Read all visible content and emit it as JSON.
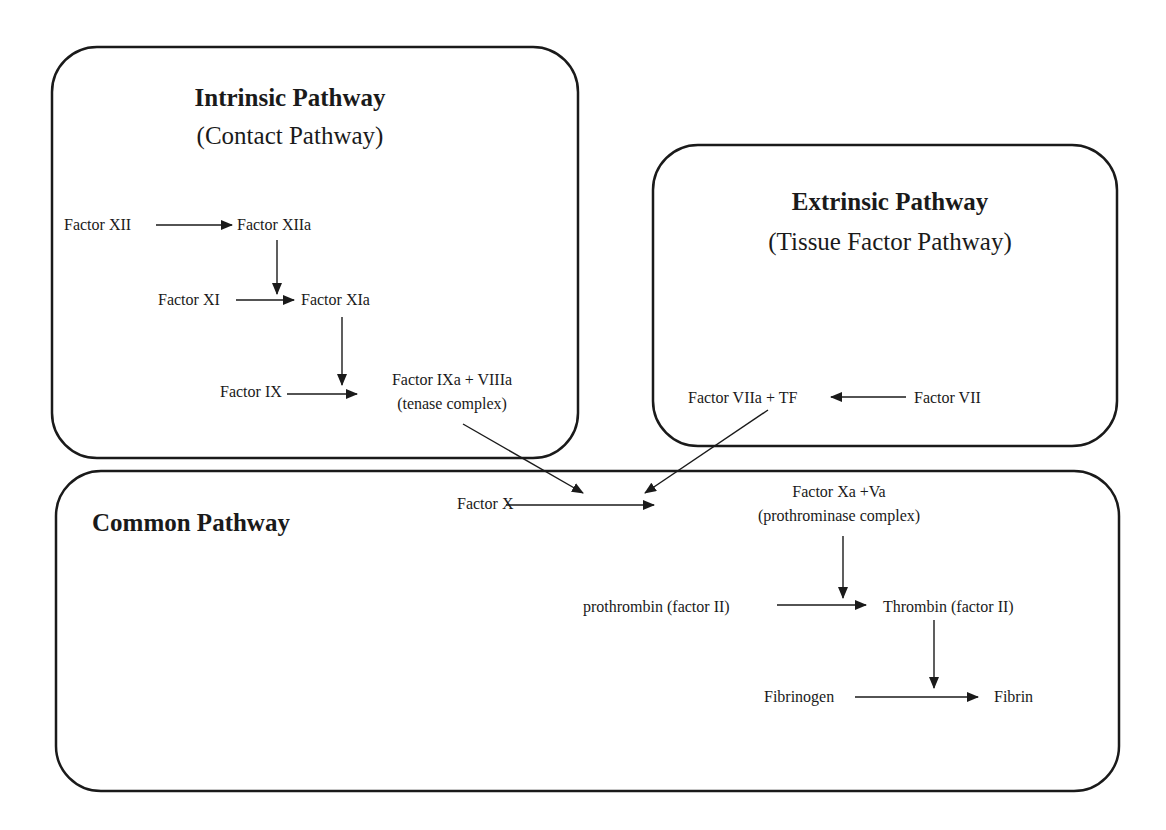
{
  "diagram": {
    "panels": {
      "intrinsic": {
        "title": "Intrinsic Pathway",
        "subtitle": "(Contact Pathway)"
      },
      "extrinsic": {
        "title": "Extrinsic Pathway",
        "subtitle": "(Tissue Factor Pathway)"
      },
      "common": {
        "title": "Common Pathway"
      }
    },
    "nodes": {
      "factor_xii": "Factor XII",
      "factor_xiia": "Factor XIIa",
      "factor_xi": "Factor XI",
      "factor_xia": "Factor XIa",
      "factor_ix": "Factor IX",
      "factor_ixa_viiia": "Factor IXa + VIIIa",
      "tenase_note": "(tenase complex)",
      "factor_viia_tf": "Factor VIIa + TF",
      "factor_vii": "Factor VII",
      "factor_x": "Factor X",
      "factor_xa_va": "Factor Xa +Va",
      "prothrominase_note": "(prothrominase complex)",
      "prothrombin": "prothrombin (factor II)",
      "thrombin": "Thrombin (factor II)",
      "fibrinogen": "Fibrinogen",
      "fibrin": "Fibrin"
    },
    "edges": [
      {
        "from": "Factor XII",
        "to": "Factor XIIa"
      },
      {
        "from": "Factor XIIa",
        "to": "Factor XI → Factor XIa (catalyst)"
      },
      {
        "from": "Factor XI",
        "to": "Factor XIa"
      },
      {
        "from": "Factor XIa",
        "to": "Factor IX → Factor IXa + VIIIa (catalyst)"
      },
      {
        "from": "Factor IX",
        "to": "Factor IXa + VIIIa"
      },
      {
        "from": "Factor VII",
        "to": "Factor VIIa + TF"
      },
      {
        "from": "Factor IXa + VIIIa",
        "to": "Factor X → Factor Xa +Va (catalyst)"
      },
      {
        "from": "Factor VIIa + TF",
        "to": "Factor X → Factor Xa +Va (catalyst)"
      },
      {
        "from": "Factor X",
        "to": "Factor Xa +Va"
      },
      {
        "from": "Factor Xa +Va",
        "to": "prothrombin → Thrombin (catalyst)"
      },
      {
        "from": "prothrombin (factor II)",
        "to": "Thrombin (factor II)"
      },
      {
        "from": "Thrombin (factor II)",
        "to": "Fibrinogen → Fibrin (catalyst)"
      },
      {
        "from": "Fibrinogen",
        "to": "Fibrin"
      }
    ]
  }
}
